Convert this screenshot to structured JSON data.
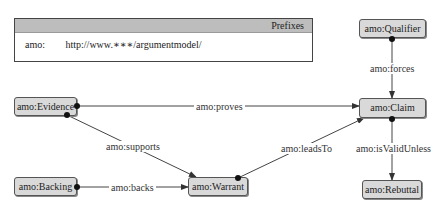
{
  "prefixes": {
    "title": "Prefixes",
    "entries": [
      {
        "prefix": "amo:",
        "uri": "http://www.∗∗∗/argumentmodel/"
      }
    ]
  },
  "nodes": {
    "evidence": {
      "label": "amo:Evidence",
      "x": 14,
      "y": 97,
      "w": 63,
      "h": 19
    },
    "backing": {
      "label": "amo:Backing",
      "x": 14,
      "y": 177,
      "w": 63,
      "h": 19
    },
    "warrant": {
      "label": "amo:Warrant",
      "x": 188,
      "y": 177,
      "w": 60,
      "h": 19
    },
    "claim": {
      "label": "amo:Claim",
      "x": 359,
      "y": 98,
      "w": 67,
      "h": 20
    },
    "qualifier": {
      "label": "amo:Qualifier",
      "x": 359,
      "y": 19,
      "w": 67,
      "h": 19
    },
    "rebuttal": {
      "label": "amo:Rebuttal",
      "x": 362,
      "y": 180,
      "w": 60,
      "h": 19
    }
  },
  "edges": [
    {
      "label": "amo:proves",
      "from": [
        77,
        106
      ],
      "to": [
        359,
        106
      ],
      "lx": 194,
      "ly": 101
    },
    {
      "label": "amo:supports",
      "from": [
        67,
        115
      ],
      "to": [
        196,
        177
      ],
      "lx": 104,
      "ly": 141
    },
    {
      "label": "amo:backs",
      "from": [
        77,
        187
      ],
      "to": [
        188,
        187
      ],
      "lx": 109,
      "ly": 182
    },
    {
      "label": "amo:leadsTo",
      "from": [
        238,
        178
      ],
      "to": [
        364,
        118
      ],
      "lx": 279,
      "ly": 143
    },
    {
      "label": "amo:forces",
      "from": [
        392,
        39
      ],
      "to": [
        392,
        98
      ],
      "lx": 368,
      "ly": 63
    },
    {
      "label": "amo:isValidUnless",
      "from": [
        392,
        119
      ],
      "to": [
        392,
        180
      ],
      "lx": 354,
      "ly": 143
    }
  ],
  "colors": {
    "node_fill": "#d9d9d9",
    "header_fill": "#bdbdbd",
    "line": "#444444"
  }
}
